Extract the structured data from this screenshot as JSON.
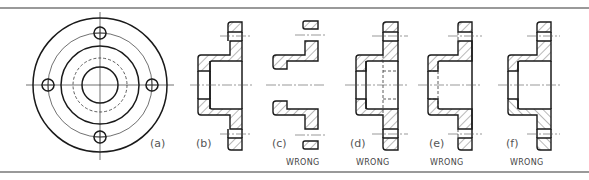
{
  "figure": {
    "views": [
      {
        "id": "a",
        "label": "(a)",
        "caption": "",
        "type": "end view"
      },
      {
        "id": "b",
        "label": "(b)",
        "caption": "",
        "type": "correct full section"
      },
      {
        "id": "c",
        "label": "(c)",
        "caption": "WRONG",
        "type": "section missing visible lines"
      },
      {
        "id": "d",
        "label": "(d)",
        "caption": "WRONG",
        "type": "section with unnecessary hidden lines"
      },
      {
        "id": "e",
        "label": "(e)",
        "caption": "WRONG",
        "type": "section with hidden lines in hatching"
      },
      {
        "id": "f",
        "label": "(f)",
        "caption": "WRONG",
        "type": "section with inconsistent hatching direction"
      }
    ]
  },
  "colors": {
    "line": "#1a1a1a",
    "frame": "#777777",
    "text": "#555555",
    "background": "#ffffff"
  }
}
